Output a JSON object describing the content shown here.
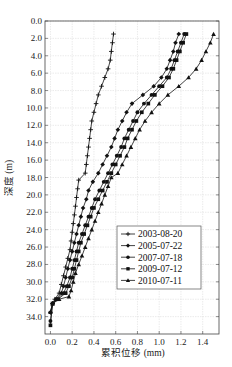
{
  "chart_data": {
    "type": "line",
    "title": "",
    "xlabel": "累积位移 (mm)",
    "ylabel": "深度 (m)",
    "xlim": [
      -0.05,
      1.55
    ],
    "ylim": [
      0.0,
      36.0
    ],
    "y_inverted": true,
    "grid": true,
    "legend_position": "lower right (inside)",
    "x_ticks": [
      "0.0",
      "0.2",
      "0.4",
      "0.6",
      "0.8",
      "1.0",
      "1.2",
      "1.4"
    ],
    "y_ticks": [
      "0.0",
      "2.0",
      "4.0",
      "6.0",
      "8.0",
      "10.0",
      "12.0",
      "14.0",
      "16.0",
      "18.0",
      "20.0",
      "22.0",
      "24.0",
      "26.0",
      "28.0",
      "30.0",
      "32.0",
      "34.0"
    ],
    "series": [
      {
        "name": "2003-08-20",
        "marker": "plus",
        "points": [
          [
            0.58,
            1.5
          ],
          [
            0.57,
            2.5
          ],
          [
            0.56,
            3.5
          ],
          [
            0.55,
            4.5
          ],
          [
            0.53,
            5.5
          ],
          [
            0.5,
            6.5
          ],
          [
            0.47,
            7.5
          ],
          [
            0.44,
            8.5
          ],
          [
            0.42,
            9.5
          ],
          [
            0.4,
            10.5
          ],
          [
            0.38,
            11.5
          ],
          [
            0.37,
            12.5
          ],
          [
            0.36,
            13.5
          ],
          [
            0.35,
            14.5
          ],
          [
            0.34,
            15.5
          ],
          [
            0.33,
            16.5
          ],
          [
            0.32,
            17.5
          ],
          [
            0.26,
            18.3
          ],
          [
            0.25,
            19.3
          ],
          [
            0.24,
            20.3
          ],
          [
            0.23,
            21.3
          ],
          [
            0.22,
            22.3
          ],
          [
            0.21,
            23.3
          ],
          [
            0.2,
            24.3
          ],
          [
            0.19,
            25.3
          ],
          [
            0.18,
            26.3
          ],
          [
            0.16,
            27.3
          ],
          [
            0.14,
            28.3
          ],
          [
            0.12,
            29.3
          ],
          [
            0.1,
            30.3
          ],
          [
            0.08,
            31.3
          ],
          [
            0.04,
            32.0
          ],
          [
            0.02,
            32.5
          ],
          [
            0.0,
            33.5
          ]
        ]
      },
      {
        "name": "2005-07-22",
        "marker": "diamond",
        "points": [
          [
            1.18,
            1.5
          ],
          [
            1.15,
            2.5
          ],
          [
            1.13,
            3.5
          ],
          [
            1.1,
            4.5
          ],
          [
            1.07,
            5.5
          ],
          [
            1.02,
            6.5
          ],
          [
            0.95,
            7.5
          ],
          [
            0.85,
            8.5
          ],
          [
            0.75,
            9.5
          ],
          [
            0.7,
            10.5
          ],
          [
            0.66,
            11.5
          ],
          [
            0.62,
            12.5
          ],
          [
            0.59,
            13.5
          ],
          [
            0.56,
            14.5
          ],
          [
            0.52,
            15.5
          ],
          [
            0.48,
            16.5
          ],
          [
            0.44,
            17.5
          ],
          [
            0.39,
            18.5
          ],
          [
            0.35,
            19.5
          ],
          [
            0.33,
            20.5
          ],
          [
            0.3,
            21.5
          ],
          [
            0.28,
            22.5
          ],
          [
            0.26,
            23.5
          ],
          [
            0.24,
            24.5
          ],
          [
            0.22,
            25.5
          ],
          [
            0.2,
            26.5
          ],
          [
            0.18,
            27.5
          ],
          [
            0.16,
            28.5
          ],
          [
            0.14,
            29.5
          ],
          [
            0.12,
            30.5
          ],
          [
            0.1,
            31.3
          ],
          [
            0.05,
            32.0
          ],
          [
            0.02,
            32.5
          ],
          [
            0.0,
            33.5
          ]
        ]
      },
      {
        "name": "2007-07-18",
        "marker": "circle",
        "points": [
          [
            1.23,
            1.5
          ],
          [
            1.2,
            2.5
          ],
          [
            1.17,
            3.5
          ],
          [
            1.14,
            4.5
          ],
          [
            1.11,
            5.5
          ],
          [
            1.07,
            6.5
          ],
          [
            1.0,
            7.5
          ],
          [
            0.93,
            8.5
          ],
          [
            0.86,
            9.5
          ],
          [
            0.8,
            10.5
          ],
          [
            0.76,
            11.5
          ],
          [
            0.72,
            12.5
          ],
          [
            0.68,
            13.5
          ],
          [
            0.65,
            14.5
          ],
          [
            0.61,
            15.5
          ],
          [
            0.57,
            16.5
          ],
          [
            0.53,
            17.5
          ],
          [
            0.49,
            18.5
          ],
          [
            0.45,
            19.5
          ],
          [
            0.41,
            20.5
          ],
          [
            0.38,
            21.5
          ],
          [
            0.35,
            22.5
          ],
          [
            0.32,
            23.5
          ],
          [
            0.29,
            24.5
          ],
          [
            0.26,
            25.5
          ],
          [
            0.24,
            26.5
          ],
          [
            0.22,
            27.5
          ],
          [
            0.2,
            28.5
          ],
          [
            0.18,
            29.5
          ],
          [
            0.15,
            30.5
          ],
          [
            0.12,
            31.3
          ],
          [
            0.06,
            32.0
          ],
          [
            0.02,
            32.5
          ],
          [
            0.0,
            34.5
          ]
        ]
      },
      {
        "name": "2009-07-12",
        "marker": "square",
        "points": [
          [
            1.25,
            1.5
          ],
          [
            1.22,
            2.5
          ],
          [
            1.19,
            3.5
          ],
          [
            1.16,
            4.5
          ],
          [
            1.13,
            5.5
          ],
          [
            1.09,
            6.5
          ],
          [
            1.03,
            7.5
          ],
          [
            0.96,
            8.5
          ],
          [
            0.9,
            9.5
          ],
          [
            0.84,
            10.5
          ],
          [
            0.79,
            11.5
          ],
          [
            0.75,
            12.5
          ],
          [
            0.71,
            13.5
          ],
          [
            0.68,
            14.5
          ],
          [
            0.64,
            15.5
          ],
          [
            0.6,
            16.5
          ],
          [
            0.56,
            17.5
          ],
          [
            0.52,
            18.5
          ],
          [
            0.48,
            19.5
          ],
          [
            0.44,
            20.5
          ],
          [
            0.4,
            21.5
          ],
          [
            0.37,
            22.5
          ],
          [
            0.34,
            23.5
          ],
          [
            0.31,
            24.5
          ],
          [
            0.28,
            25.5
          ],
          [
            0.26,
            26.5
          ],
          [
            0.24,
            27.5
          ],
          [
            0.22,
            28.5
          ],
          [
            0.2,
            29.5
          ],
          [
            0.17,
            30.5
          ],
          [
            0.14,
            31.3
          ],
          [
            0.07,
            32.0
          ],
          [
            0.02,
            32.5
          ],
          [
            0.0,
            35.0
          ]
        ]
      },
      {
        "name": "2010-07-11",
        "marker": "triangle",
        "points": [
          [
            1.5,
            1.5
          ],
          [
            1.47,
            2.5
          ],
          [
            1.43,
            3.5
          ],
          [
            1.39,
            4.5
          ],
          [
            1.34,
            5.5
          ],
          [
            1.27,
            6.5
          ],
          [
            1.18,
            7.5
          ],
          [
            1.08,
            8.5
          ],
          [
            1.0,
            9.5
          ],
          [
            0.93,
            10.5
          ],
          [
            0.87,
            11.5
          ],
          [
            0.82,
            12.5
          ],
          [
            0.78,
            13.5
          ],
          [
            0.74,
            14.5
          ],
          [
            0.7,
            15.5
          ],
          [
            0.66,
            16.5
          ],
          [
            0.62,
            17.5
          ],
          [
            0.56,
            18.0
          ],
          [
            0.53,
            19.0
          ],
          [
            0.5,
            20.0
          ],
          [
            0.47,
            21.0
          ],
          [
            0.44,
            22.0
          ],
          [
            0.41,
            23.0
          ],
          [
            0.38,
            24.0
          ],
          [
            0.35,
            25.0
          ],
          [
            0.32,
            26.0
          ],
          [
            0.29,
            27.0
          ],
          [
            0.26,
            28.0
          ],
          [
            0.23,
            29.0
          ],
          [
            0.21,
            30.0
          ],
          [
            0.19,
            31.0
          ],
          [
            0.17,
            31.7
          ],
          [
            0.08,
            32.0
          ],
          [
            0.02,
            32.5
          ],
          [
            0.0,
            33.5
          ]
        ]
      }
    ]
  },
  "legend": {
    "items": [
      {
        "label": "2003-08-20"
      },
      {
        "label": "2005-07-22"
      },
      {
        "label": "2007-07-18"
      },
      {
        "label": "2009-07-12"
      },
      {
        "label": "2010-07-11"
      }
    ]
  },
  "axes": {
    "xlabel": "累积位移 (mm)",
    "ylabel": "深度 (m)"
  }
}
